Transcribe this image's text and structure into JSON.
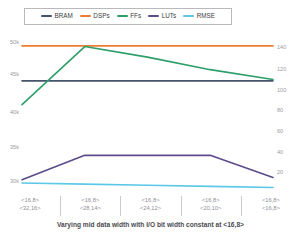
{
  "legend": {
    "items": [
      {
        "label": "BRAM",
        "color": "#44546a",
        "icon": "line-swatch"
      },
      {
        "label": "DSPs",
        "color": "#ed7d31",
        "icon": "line-swatch"
      },
      {
        "label": "FFs",
        "color": "#2e9e6b",
        "icon": "line-swatch"
      },
      {
        "label": "LUTs",
        "color": "#5b4b8a",
        "icon": "line-swatch"
      },
      {
        "label": "RMSE",
        "color": "#5bc8e8",
        "icon": "line-swatch"
      }
    ]
  },
  "chart_data": {
    "type": "line",
    "title": "Varying mid data width with I/O bit width constant at <16,8>",
    "xlabel": "Varying mid data width with I/O bit width constant at <16,8>",
    "ylabel": "",
    "grid": false,
    "legend_position": "top",
    "categories": [
      "<16,8>\n<32,16>",
      "<16,8>\n<28,14>",
      "<16,8>\n<24,12>",
      "<16,8>\n<20,10>",
      "<16,8>\n<16,8>"
    ],
    "category_lines": [
      [
        "<16,8>",
        "<32,16>"
      ],
      [
        "<16,8>",
        "<28,14>"
      ],
      [
        "<16,8>",
        "<24,12>"
      ],
      [
        "<16,8>",
        "<20,10>"
      ],
      [
        "<16,8>",
        "<16,8>"
      ]
    ],
    "left_axis": {
      "ticks": [
        "50k",
        "45k",
        "40k",
        "35k",
        "30k"
      ],
      "tick_values": [
        50000,
        45000,
        40000,
        35000,
        30000
      ],
      "ylim": [
        28000,
        51500
      ]
    },
    "right_axis": {
      "ticks": [
        "140",
        "120",
        "100",
        "80",
        "60",
        "40",
        "20"
      ],
      "tick_values": [
        140,
        120,
        100,
        80,
        60,
        40,
        20
      ],
      "ylim": [
        8,
        148
      ]
    },
    "series": [
      {
        "name": "BRAM",
        "color": "#44546a",
        "axis": "left",
        "values": [
          45000,
          45000,
          45000,
          45000,
          45000
        ]
      },
      {
        "name": "DSPs",
        "color": "#ed7d31",
        "axis": "left",
        "values": [
          50300,
          50300,
          50300,
          50300,
          50300
        ]
      },
      {
        "name": "FFs",
        "color": "#2e9e6b",
        "axis": "left",
        "values": [
          41400,
          50200,
          48600,
          46700,
          45200
        ]
      },
      {
        "name": "LUTs",
        "color": "#5b4b8a",
        "axis": "right",
        "values": [
          20,
          42,
          42,
          42,
          22
        ]
      },
      {
        "name": "RMSE",
        "color": "#5bc8e8",
        "axis": "right",
        "values": [
          17,
          16,
          15,
          14,
          13
        ]
      }
    ]
  }
}
